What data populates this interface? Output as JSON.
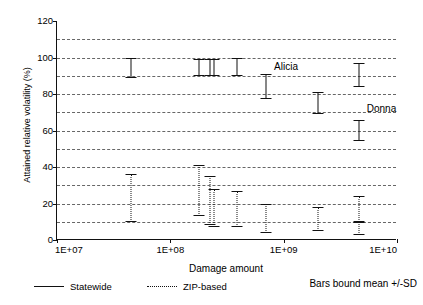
{
  "chart_data": {
    "type": "scatter",
    "title": "",
    "xlabel": "Damage amount",
    "ylabel": "Attained relative volatility (%)",
    "xscale": "log",
    "xlim": [
      10000000,
      10000000000
    ],
    "ylim": [
      0,
      120
    ],
    "yticks": [
      0,
      20,
      40,
      60,
      80,
      100,
      120
    ],
    "ytick_labels": [
      "0",
      "20",
      "40",
      "60",
      "80",
      "100",
      "120"
    ],
    "gridlines_y": [
      10,
      20,
      30,
      40,
      50,
      60,
      70,
      80,
      90,
      100,
      110
    ],
    "grid": true,
    "xticks": [
      10000000,
      100000000,
      1000000000,
      10000000000
    ],
    "xtick_labels": [
      "1E+07",
      "1E+08",
      "1E+09",
      "1E+10"
    ],
    "legend_position": "below-plot",
    "error_bar_meaning": "Bars bound mean +/-SD",
    "series": [
      {
        "name": "Statewide",
        "style": "solid",
        "points": [
          {
            "x": 45000000,
            "high": 100,
            "low": 89,
            "mean": 94.5
          },
          {
            "x": 180000000,
            "high": 99,
            "low": 90,
            "mean": 94.5
          },
          {
            "x": 225000000,
            "high": 99,
            "low": 90,
            "mean": 94.5
          },
          {
            "x": 245000000,
            "high": 99,
            "low": 90,
            "mean": 94.5
          },
          {
            "x": 390000000,
            "high": 100,
            "low": 90,
            "mean": 95.0
          },
          {
            "x": 700000000,
            "high": 91,
            "low": 77,
            "mean": 84.0
          },
          {
            "x": 2000000000,
            "high": 81,
            "low": 69,
            "mean": 75.0
          },
          {
            "x": 4600000000,
            "high": 97,
            "low": 84,
            "mean": 90.5
          },
          {
            "x": 4600000000,
            "high": 66,
            "low": 54,
            "mean": 60.0
          }
        ]
      },
      {
        "name": "ZIP-based",
        "style": "dotted",
        "points": [
          {
            "x": 45000000,
            "high": 36,
            "low": 10,
            "mean": 23.0
          },
          {
            "x": 180000000,
            "high": 41,
            "low": 13,
            "mean": 27.0
          },
          {
            "x": 225000000,
            "high": 35,
            "low": 8,
            "mean": 21.5
          },
          {
            "x": 245000000,
            "high": 28,
            "low": 7,
            "mean": 17.5
          },
          {
            "x": 390000000,
            "high": 27,
            "low": 7,
            "mean": 17.0
          },
          {
            "x": 700000000,
            "high": 20,
            "low": 4,
            "mean": 12.0
          },
          {
            "x": 2000000000,
            "high": 18,
            "low": 5,
            "mean": 11.5
          },
          {
            "x": 4600000000,
            "high": 24,
            "low": 10,
            "mean": 17.0
          },
          {
            "x": 4600000000,
            "high": 10,
            "low": 3,
            "mean": 6.5
          }
        ]
      }
    ],
    "annotations": [
      {
        "text": "Alicia",
        "x": 700000000,
        "y": 94
      },
      {
        "text": "Donna",
        "x": 4600000000,
        "y": 71
      }
    ]
  },
  "legend": {
    "statewide_label": "Statewide",
    "zip_label": "ZIP-based",
    "note": "Bars bound mean +/-SD"
  },
  "axes": {
    "y_title": "Attained relative volatility (%)",
    "x_title": "Damage amount",
    "y_tick_0": "0",
    "y_tick_20": "20",
    "y_tick_40": "40",
    "y_tick_60": "60",
    "y_tick_80": "80",
    "y_tick_100": "100",
    "y_tick_120": "120",
    "x_tick_1": "1E+07",
    "x_tick_2": "1E+08",
    "x_tick_3": "1E+09",
    "x_tick_4": "1E+10"
  },
  "annotations": {
    "alicia": "Alicia",
    "donna": "Donna"
  }
}
